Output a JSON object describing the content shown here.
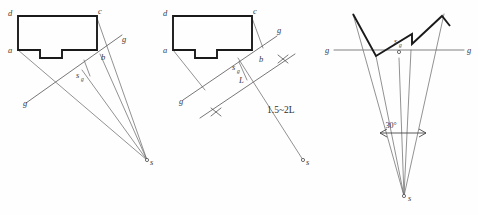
{
  "figure": {
    "panels": [
      {
        "id": "panel-1",
        "name": "plan-view-single-hole",
        "labels": {
          "corner_d": "d",
          "corner_a": "a",
          "corner_c": "c",
          "corner_b": "b",
          "g_upper_right": "g",
          "g_lower_left": "g",
          "s_sub_g": "s",
          "s_sub_g_sub": "g",
          "charge_point": "s"
        }
      },
      {
        "id": "panel-2",
        "name": "plan-view-with-spacing",
        "labels": {
          "corner_d": "d",
          "corner_a": "a",
          "corner_c": "c",
          "corner_b": "b",
          "g_upper_right": "g",
          "g_lower_left": "g",
          "s_sub_g": "s",
          "s_sub_g_sub": "g",
          "length_L": "L",
          "spacing_note": "1.5~2L",
          "charge_point": "s"
        }
      },
      {
        "id": "panel-3",
        "name": "section-view-angle",
        "labels": {
          "g_left": "g",
          "g_right": "g",
          "s_sub_g": "s",
          "s_sub_g_sub": "g",
          "angle": "30°",
          "charge_point": "s"
        }
      }
    ],
    "colors": {
      "outline": "#1a1a1a",
      "thin_line": "#6e6e6e",
      "ground_line": "#7a7a7a",
      "text": "#3a3a3a",
      "background": "#fefefe"
    }
  }
}
